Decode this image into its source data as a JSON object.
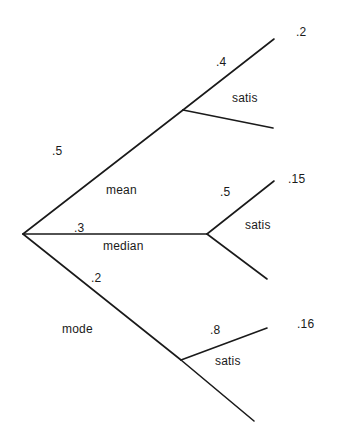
{
  "diagram": {
    "type": "probability-tree",
    "root": {
      "x": 23,
      "y": 234
    },
    "branches": [
      {
        "id": "mean",
        "label": "mean",
        "probability": ".5",
        "node": {
          "x": 183,
          "y": 110
        },
        "children": [
          {
            "id": "mean-satis",
            "probability": ".4",
            "joint": ".2",
            "end": {
              "x": 274,
              "y": 39
            }
          },
          {
            "id": "mean-not",
            "probability": "",
            "joint": "",
            "end": {
              "x": 273,
              "y": 128
            }
          }
        ],
        "child_label": "satis"
      },
      {
        "id": "median",
        "label": "median",
        "probability": ".3",
        "node": {
          "x": 207,
          "y": 234
        },
        "children": [
          {
            "id": "median-satis",
            "probability": ".5",
            "joint": ".15",
            "end": {
              "x": 274,
              "y": 181
            }
          },
          {
            "id": "median-not",
            "probability": "",
            "joint": "",
            "end": {
              "x": 267,
              "y": 279
            }
          }
        ],
        "child_label": "satis"
      },
      {
        "id": "mode",
        "label": "mode",
        "probability": ".2",
        "node": {
          "x": 181,
          "y": 360
        },
        "children": [
          {
            "id": "mode-satis",
            "probability": ".8",
            "joint": ".16",
            "end": {
              "x": 267,
              "y": 328
            }
          },
          {
            "id": "mode-not",
            "probability": "",
            "joint": "",
            "end": {
              "x": 254,
              "y": 421
            }
          }
        ],
        "child_label": "satis"
      }
    ],
    "labels": {
      "mean_prob": ".5",
      "mean_name": "mean",
      "mean_satis_prob": ".4",
      "mean_satis": "satis",
      "mean_joint": ".2",
      "median_prob": ".3",
      "median_name": "median",
      "median_satis_prob": ".5",
      "median_satis": "satis",
      "median_joint": ".15",
      "mode_prob": ".2",
      "mode_name": "mode",
      "mode_satis_prob": ".8",
      "mode_satis": "satis",
      "mode_joint": ".16"
    },
    "colors": {
      "line": "#1a1a1a",
      "text": "#1a1a1a",
      "background": "#ffffff"
    }
  }
}
